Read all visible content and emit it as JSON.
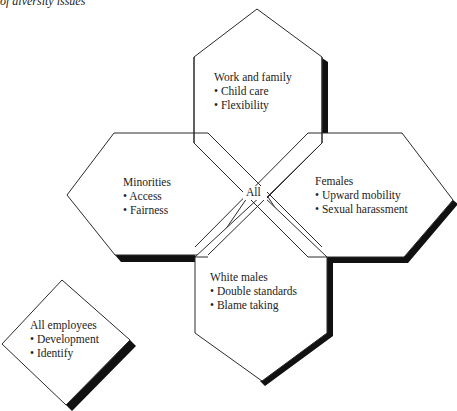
{
  "caption": "of diversity issues",
  "center_label": "All",
  "groups": [
    {
      "id": "work-family",
      "title": "Work and family",
      "items": [
        "Child care",
        "Flexibility"
      ]
    },
    {
      "id": "minorities",
      "title": "Minorities",
      "items": [
        "Access",
        "Fairness"
      ]
    },
    {
      "id": "females",
      "title": "Females",
      "items": [
        "Upward mobility",
        "Sexual harassment"
      ]
    },
    {
      "id": "white-males",
      "title": "White males",
      "items": [
        "Double standards",
        "Blame taking"
      ]
    },
    {
      "id": "all-employees",
      "title": "All employees",
      "items": [
        "Development",
        "Identify"
      ]
    }
  ],
  "bullet": "•",
  "colors": {
    "stroke": "#2a2a2a",
    "shadow": "#111111",
    "fill": "#ffffff"
  }
}
